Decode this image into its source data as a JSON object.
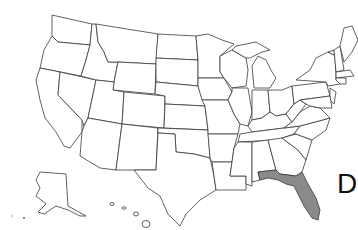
{
  "map": {
    "region": "United States",
    "highlighted_states": [
      "Florida"
    ],
    "highlight_color": "#8a8a8a",
    "outline_color": "#3a3a3a",
    "label": "D"
  }
}
